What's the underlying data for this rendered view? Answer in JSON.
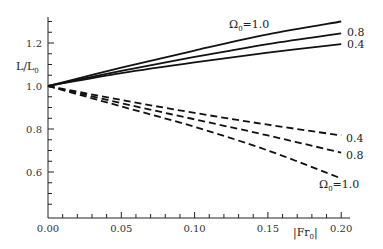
{
  "chart_data": {
    "type": "line",
    "title": "",
    "xlabel": "|Fr0|",
    "ylabel": "L/L0",
    "xlim": [
      0.0,
      0.205
    ],
    "ylim": [
      0.42,
      1.33
    ],
    "x_ticks": [
      0.0,
      0.05,
      0.1,
      0.15,
      0.2
    ],
    "x_tick_labels": [
      "0.00",
      "0.05",
      "0.10",
      "0.15",
      "0.20"
    ],
    "y_ticks": [
      0.6,
      0.8,
      1.0,
      1.2
    ],
    "y_tick_labels": [
      "0.6",
      "0.8",
      "1.0",
      "1.2"
    ],
    "grid": false,
    "legend": "none",
    "x": [
      0.0,
      0.05,
      0.1,
      0.15,
      0.2
    ],
    "series": [
      {
        "name": "Ω0=1.0 (solid)",
        "style": "solid",
        "values": [
          1.0,
          1.085,
          1.165,
          1.24,
          1.3
        ]
      },
      {
        "name": "Ω0=0.8 (solid)",
        "style": "solid",
        "values": [
          1.0,
          1.07,
          1.135,
          1.195,
          1.245
        ]
      },
      {
        "name": "Ω0=0.4 (solid)",
        "style": "solid",
        "values": [
          1.0,
          1.06,
          1.11,
          1.155,
          1.195
        ]
      },
      {
        "name": "Ω0=0.4 (dashed)",
        "style": "dashed",
        "values": [
          1.0,
          0.935,
          0.875,
          0.82,
          0.77
        ]
      },
      {
        "name": "Ω0=0.8 (dashed)",
        "style": "dashed",
        "values": [
          1.0,
          0.92,
          0.845,
          0.77,
          0.69
        ]
      },
      {
        "name": "Ω0=1.0 (dashed)",
        "style": "dashed",
        "values": [
          1.0,
          0.905,
          0.81,
          0.7,
          0.57
        ]
      }
    ],
    "annotations": [
      {
        "text_main": "Ω",
        "text_sub": "0",
        "text_rest": "=1.0",
        "target": "Ω0=1.0 (solid)"
      },
      {
        "text": "0.8",
        "target": "Ω0=0.8 (solid)"
      },
      {
        "text": "0.4",
        "target": "Ω0=0.4 (solid)"
      },
      {
        "text": "0.4",
        "target": "Ω0=0.4 (dashed)"
      },
      {
        "text": "0.8",
        "target": "Ω0=0.8 (dashed)"
      },
      {
        "text_main": "Ω",
        "text_sub": "0",
        "text_rest": "=1.0",
        "target": "Ω0=1.0 (dashed)"
      }
    ],
    "axis_labels": {
      "y_main": "L/L",
      "y_sub": "0",
      "x_main": "|Fr",
      "x_sub": "0",
      "x_end": "|"
    }
  }
}
